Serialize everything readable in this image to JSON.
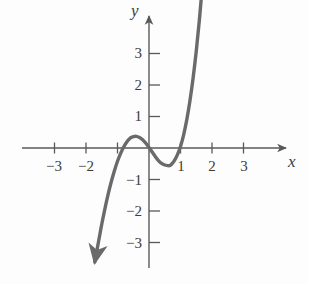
{
  "figure": {
    "title": "",
    "background_color": "#fdfdfd",
    "curve_color": "#6a6a6a",
    "axis_color": "#595959",
    "text_color": "#3b3b3b"
  },
  "axes": {
    "x_label": "x",
    "y_label": "y",
    "origin_px": {
      "x": 149,
      "y": 148
    },
    "unit_px": 31.5,
    "x_tick_labels": [
      "−3",
      "−2",
      "1",
      "2",
      "3"
    ],
    "x_tick_values": [
      -3,
      -2,
      1,
      2,
      3
    ],
    "x_all_tick_values": [
      -3,
      -2,
      -1,
      1,
      2,
      3
    ],
    "y_tick_labels": [
      "3",
      "2",
      "1",
      "−1",
      "−2",
      "−3"
    ],
    "y_tick_values": [
      3,
      2,
      1,
      -1,
      -2,
      -3
    ],
    "x_arrow": "right",
    "y_arrow": "up",
    "xlim": [
      -3.9,
      4.6
    ],
    "ylim": [
      -4.2,
      4.3
    ],
    "grid": false
  },
  "chart_data": {
    "type": "line",
    "title": "",
    "xlabel": "x",
    "ylabel": "y",
    "xlim": [
      -3.9,
      4.6
    ],
    "ylim": [
      -4.2,
      4.3
    ],
    "grid": false,
    "legend": null,
    "series": [
      {
        "name": "curve",
        "color": "#6a6a6a",
        "arrow_start": true,
        "arrow_end": true,
        "roots": [
          -1.0,
          0.2,
          1.0
        ],
        "local_maximum": {
          "x": -0.55,
          "y": 0.48
        },
        "local_minimum": {
          "x": 0.65,
          "y": -0.45
        },
        "x": [
          -1.72,
          -1.6,
          -1.5,
          -1.4,
          -1.3,
          -1.2,
          -1.1,
          -1.0,
          -0.9,
          -0.8,
          -0.7,
          -0.6,
          -0.55,
          -0.5,
          -0.4,
          -0.3,
          -0.2,
          -0.1,
          0.0,
          0.1,
          0.2,
          0.3,
          0.4,
          0.5,
          0.6,
          0.65,
          0.7,
          0.8,
          0.9,
          1.0,
          1.1,
          1.2,
          1.3,
          1.4,
          1.5,
          1.6,
          1.7,
          1.8,
          1.85
        ],
        "y": [
          -3.62,
          -2.96,
          -2.42,
          -1.93,
          -1.48,
          -1.08,
          -0.73,
          -0.42,
          -0.17,
          0.04,
          0.2,
          0.31,
          0.34,
          0.36,
          0.37,
          0.33,
          0.26,
          0.15,
          0.02,
          -0.13,
          -0.27,
          -0.4,
          -0.49,
          -0.54,
          -0.56,
          -0.56,
          -0.53,
          -0.41,
          -0.22,
          0.05,
          0.42,
          0.9,
          1.5,
          2.22,
          3.07,
          4.07,
          5.22,
          6.53,
          7.25
        ]
      }
    ]
  }
}
